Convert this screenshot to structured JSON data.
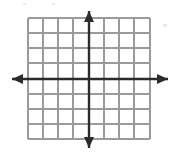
{
  "figure": {
    "title": "",
    "caption": "",
    "type": "blank-cartesian-coordinate-grid"
  },
  "canvas": {
    "width": 174,
    "height": 155,
    "background_color": "#ffffff"
  },
  "chart_data": {
    "type": "scatter",
    "title": "",
    "subtitle": "",
    "xlabel": "",
    "ylabel": "",
    "xlim": [
      -5,
      5
    ],
    "ylim": [
      -4,
      4
    ],
    "xticks": [
      -5,
      -4,
      -3,
      -2,
      -1,
      0,
      1,
      2,
      3,
      4,
      5
    ],
    "yticks": [
      -4,
      -3,
      -2,
      -1,
      0,
      1,
      2,
      3,
      4
    ],
    "xtick_labels": [
      "",
      "",
      "",
      "",
      "",
      "",
      "",
      "",
      "",
      "",
      ""
    ],
    "ytick_labels": [
      "",
      "",
      "",
      "",
      "",
      "",
      "",
      "",
      ""
    ],
    "grid": true,
    "legend": false,
    "legend_position": "none",
    "series": [],
    "annotations": [],
    "x": [],
    "values": []
  },
  "grid": {
    "color": "#9a9a9a",
    "line_width": 1.6,
    "cell_size": 15,
    "left": 28,
    "top": 18,
    "right": 150,
    "bottom": 139,
    "columns": 8,
    "rows": 8,
    "vertical_line_x": [
      28,
      43,
      58,
      73,
      89,
      104,
      119,
      134,
      150
    ],
    "horizontal_line_y": [
      18,
      33,
      48,
      63,
      79,
      94,
      109,
      124,
      139
    ]
  },
  "axes": {
    "color": "#2b2b2b",
    "line_width": 2.4,
    "origin_x": 89,
    "origin_y": 79,
    "x_axis": {
      "name": "x-axis",
      "label": "",
      "start_x": 12,
      "end_x": 168,
      "y": 79,
      "arrow_left": true,
      "arrow_right": true
    },
    "y_axis": {
      "name": "y-axis",
      "label": "",
      "start_y": 11,
      "end_y": 148,
      "x": 89,
      "arrow_up": true,
      "arrow_down": true
    },
    "arrow_head": {
      "length": 11,
      "half_width": 5
    }
  },
  "icons": {
    "arrow_up": "arrow-up-icon",
    "arrow_down": "arrow-down-icon",
    "arrow_left": "arrow-left-icon",
    "arrow_right": "arrow-right-icon"
  }
}
